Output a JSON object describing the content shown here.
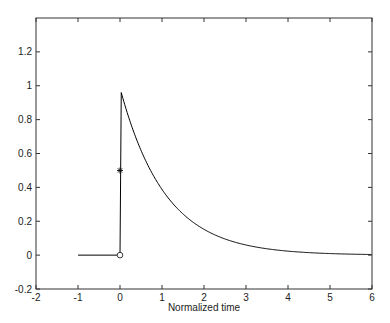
{
  "chart_data": {
    "type": "line",
    "title": "",
    "xlabel": "Normalized time",
    "ylabel": "",
    "xlim": [
      -2,
      6
    ],
    "ylim": [
      -0.2,
      1.4
    ],
    "xticks": [
      -2,
      -1,
      0,
      1,
      2,
      3,
      4,
      5,
      6
    ],
    "xtick_labels": [
      "-2",
      "-1",
      "0",
      "1",
      "2",
      "3",
      "4",
      "5",
      "6"
    ],
    "yticks": [
      -0.2,
      0,
      0.2,
      0.4,
      0.6,
      0.8,
      1,
      1.2
    ],
    "ytick_labels": [
      "-0.2",
      "0",
      "0.2",
      "0.4",
      "0.6",
      "0.8",
      "1",
      "1.2"
    ],
    "grid": false,
    "legend": null,
    "series": [
      {
        "name": "response",
        "color": "#000000",
        "x": [
          -1,
          0,
          0,
          0.03,
          0.25,
          0.5,
          0.75,
          1,
          1.25,
          1.5,
          1.75,
          2,
          2.5,
          3,
          3.5,
          4,
          4.5,
          5,
          5.5,
          6
        ],
        "y": [
          0,
          0,
          0,
          0.96,
          0.78,
          0.63,
          0.5,
          0.4,
          0.32,
          0.25,
          0.2,
          0.16,
          0.1,
          0.06,
          0.04,
          0.025,
          0.015,
          0.01,
          0.006,
          0.004
        ]
      }
    ],
    "markers": [
      {
        "name": "asterisk",
        "symbol": "*",
        "x": 0,
        "y": 0.5
      },
      {
        "name": "circle",
        "symbol": "o",
        "x": 0,
        "y": 0
      }
    ]
  }
}
